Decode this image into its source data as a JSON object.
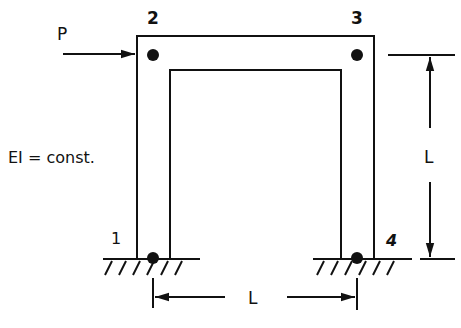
{
  "diagram": {
    "type": "portal frame",
    "nodes": [
      {
        "id": "1",
        "label": "1",
        "support": "fixed"
      },
      {
        "id": "2",
        "label": "2",
        "support": "rigid joint"
      },
      {
        "id": "3",
        "label": "3",
        "support": "rigid joint"
      },
      {
        "id": "4",
        "label": "4",
        "support": "fixed"
      }
    ],
    "load": {
      "label": "P",
      "direction": "horizontal, left-to-right",
      "applied_at_node": "2"
    },
    "property_label": "EI = const.",
    "dimensions": {
      "height": {
        "label": "L"
      },
      "span": {
        "label": "L"
      }
    }
  }
}
